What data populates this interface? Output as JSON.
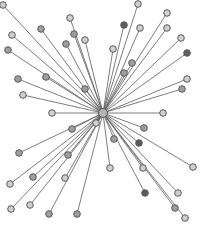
{
  "diagram": {
    "type": "star-network",
    "width": 201,
    "height": 228,
    "hub": {
      "x": 103,
      "y": 113,
      "r": 4.5,
      "fill": "#b4b4b4"
    },
    "node_radius": 3.3,
    "colors": {
      "edge": "#5f5f5f",
      "node_stroke": "#5a5a5a",
      "light": "#cfcfcf",
      "mid": "#9e9e9e",
      "dark": "#5c5c5c"
    },
    "nodes": [
      {
        "x": 3,
        "y": 5,
        "shade": "light"
      },
      {
        "x": 41,
        "y": 29,
        "shade": "mid"
      },
      {
        "x": 12,
        "y": 35,
        "shade": "light"
      },
      {
        "x": 8,
        "y": 50,
        "shade": "mid"
      },
      {
        "x": 70,
        "y": 18,
        "shade": "light"
      },
      {
        "x": 74,
        "y": 34,
        "shade": "mid"
      },
      {
        "x": 66,
        "y": 44,
        "shade": "mid"
      },
      {
        "x": 85,
        "y": 40,
        "shade": "light"
      },
      {
        "x": 18,
        "y": 79,
        "shade": "mid"
      },
      {
        "x": 46,
        "y": 77,
        "shade": "mid"
      },
      {
        "x": 23,
        "y": 95,
        "shade": "light"
      },
      {
        "x": 85,
        "y": 89,
        "shade": "mid"
      },
      {
        "x": 52,
        "y": 113,
        "shade": "light"
      },
      {
        "x": 138,
        "y": 4,
        "shade": "light"
      },
      {
        "x": 124,
        "y": 25,
        "shade": "dark"
      },
      {
        "x": 140,
        "y": 28,
        "shade": "light"
      },
      {
        "x": 167,
        "y": 13,
        "shade": "light"
      },
      {
        "x": 167,
        "y": 28,
        "shade": "light"
      },
      {
        "x": 181,
        "y": 38,
        "shade": "light"
      },
      {
        "x": 187,
        "y": 53,
        "shade": "dark"
      },
      {
        "x": 113,
        "y": 49,
        "shade": "light"
      },
      {
        "x": 132,
        "y": 63,
        "shade": "mid"
      },
      {
        "x": 124,
        "y": 73,
        "shade": "mid"
      },
      {
        "x": 187,
        "y": 79,
        "shade": "light"
      },
      {
        "x": 182,
        "y": 89,
        "shade": "mid"
      },
      {
        "x": 163,
        "y": 113,
        "shade": "light"
      },
      {
        "x": 72,
        "y": 129,
        "shade": "mid"
      },
      {
        "x": 96,
        "y": 123,
        "shade": "light"
      },
      {
        "x": 19,
        "y": 153,
        "shade": "mid"
      },
      {
        "x": 68,
        "y": 155,
        "shade": "mid"
      },
      {
        "x": 33,
        "y": 177,
        "shade": "mid"
      },
      {
        "x": 65,
        "y": 178,
        "shade": "light"
      },
      {
        "x": 10,
        "y": 184,
        "shade": "light"
      },
      {
        "x": 11,
        "y": 209,
        "shade": "light"
      },
      {
        "x": 30,
        "y": 205,
        "shade": "light"
      },
      {
        "x": 49,
        "y": 214,
        "shade": "mid"
      },
      {
        "x": 77,
        "y": 214,
        "shade": "mid"
      },
      {
        "x": 144,
        "y": 128,
        "shade": "mid"
      },
      {
        "x": 114,
        "y": 139,
        "shade": "mid"
      },
      {
        "x": 139,
        "y": 143,
        "shade": "dark"
      },
      {
        "x": 193,
        "y": 167,
        "shade": "light"
      },
      {
        "x": 110,
        "y": 168,
        "shade": "light"
      },
      {
        "x": 143,
        "y": 168,
        "shade": "light"
      },
      {
        "x": 145,
        "y": 193,
        "shade": "dark"
      },
      {
        "x": 178,
        "y": 193,
        "shade": "light"
      },
      {
        "x": 175,
        "y": 208,
        "shade": "mid"
      },
      {
        "x": 185,
        "y": 218,
        "shade": "light"
      }
    ]
  }
}
